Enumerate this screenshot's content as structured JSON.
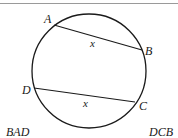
{
  "diagram": {
    "type": "geometry",
    "colors": {
      "stroke": "#1a1a1a",
      "top_rule": "#9a9a9a",
      "background": "#ffffff"
    },
    "circle": {
      "cx": 89,
      "cy": 71,
      "r": 57
    },
    "points": {
      "A": {
        "label": "A",
        "x": 54,
        "y": 25
      },
      "B": {
        "label": "B",
        "x": 142,
        "y": 50
      },
      "C": {
        "label": "C",
        "x": 135,
        "y": 102
      },
      "D": {
        "label": "D",
        "x": 34,
        "y": 88
      }
    },
    "chords": [
      {
        "from": "A",
        "to": "B",
        "length_label": "x"
      },
      {
        "from": "D",
        "to": "C",
        "length_label": "x"
      }
    ],
    "arc_labels": {
      "left": "BAD",
      "right": "DCB"
    }
  }
}
